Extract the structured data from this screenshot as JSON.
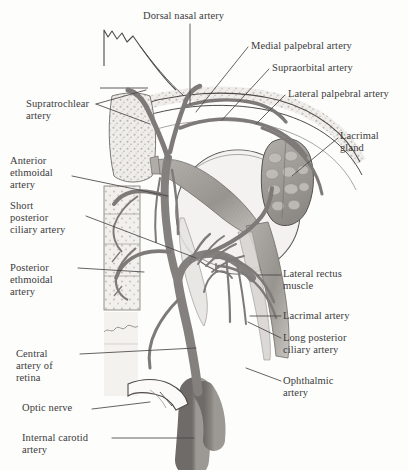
{
  "figure": {
    "background_color": "#fdfdfb",
    "text_color": "#3b3b3b",
    "leader_line_color": "#4a4646",
    "vessel_color": "#7d7a78",
    "bone_color": "#cfcdc8",
    "muscle_color": "#9b9894",
    "gland_color": "#a8a5a1"
  },
  "labels": [
    {
      "id": "dorsal-nasal-artery",
      "text": "Dorsal nasal artery",
      "x": 143,
      "y": 10,
      "align": "left"
    },
    {
      "id": "medial-palpebral-artery",
      "text": "Medial palpebral artery",
      "x": 251,
      "y": 40,
      "align": "left"
    },
    {
      "id": "supraorbital-artery",
      "text": "Supraorbital artery",
      "x": 272,
      "y": 62,
      "align": "left"
    },
    {
      "id": "lateral-palpebral-artery",
      "text": "Lateral palpebral artery",
      "x": 288,
      "y": 88,
      "align": "left"
    },
    {
      "id": "supratrochlear-artery",
      "text": "Supratrochlear\nartery",
      "x": 26,
      "y": 98,
      "align": "left"
    },
    {
      "id": "lacrimal-gland",
      "text": "Lacrimal\ngland",
      "x": 340,
      "y": 130,
      "align": "left"
    },
    {
      "id": "anterior-ethmoidal-artery",
      "text": "Anterior\nethmoidal\nartery",
      "x": 10,
      "y": 155,
      "align": "left"
    },
    {
      "id": "short-posterior-ciliary-artery",
      "text": "Short\nposterior\nciliary artery",
      "x": 10,
      "y": 200,
      "align": "left"
    },
    {
      "id": "posterior-ethmoidal-artery",
      "text": "Posterior\nethmoidal\nartery",
      "x": 10,
      "y": 262,
      "align": "left"
    },
    {
      "id": "lateral-rectus-muscle",
      "text": "Lateral rectus\nmuscle",
      "x": 283,
      "y": 268,
      "align": "left"
    },
    {
      "id": "lacrimal-artery",
      "text": "Lacrimal artery",
      "x": 283,
      "y": 310,
      "align": "left"
    },
    {
      "id": "long-posterior-ciliary-artery",
      "text": "Long posterior\nciliary artery",
      "x": 283,
      "y": 332,
      "align": "left"
    },
    {
      "id": "central-artery-of-retina",
      "text": "Central\nartery of\nretina",
      "x": 16,
      "y": 348,
      "align": "left"
    },
    {
      "id": "ophthalmic-artery",
      "text": "Ophthalmic\nartery",
      "x": 283,
      "y": 375,
      "align": "left"
    },
    {
      "id": "optic-nerve",
      "text": "Optic nerve",
      "x": 22,
      "y": 402,
      "align": "left"
    },
    {
      "id": "internal-carotid-artery",
      "text": "Internal carotid\nartery",
      "x": 22,
      "y": 432,
      "align": "left"
    }
  ]
}
